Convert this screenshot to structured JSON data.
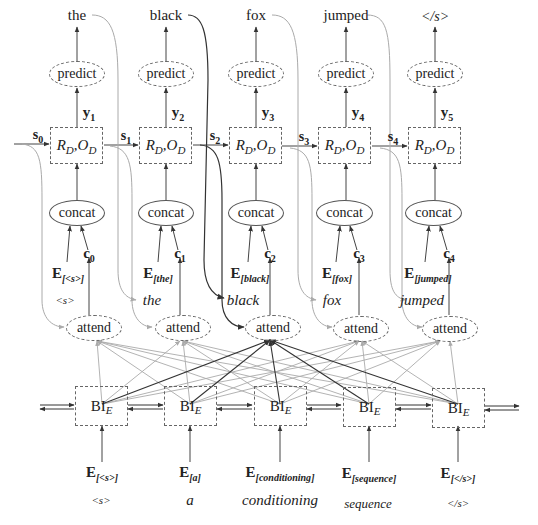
{
  "diagram": {
    "type": "encoder-decoder attention architecture",
    "columns": 5,
    "decoder": {
      "outputs": [
        "the",
        "black",
        "fox",
        "jumped",
        "</s>"
      ],
      "predict_label": "predict",
      "y_labels": [
        {
          "base": "y",
          "sub": "1"
        },
        {
          "base": "y",
          "sub": "2"
        },
        {
          "base": "y",
          "sub": "3"
        },
        {
          "base": "y",
          "sub": "4"
        },
        {
          "base": "y",
          "sub": "5"
        }
      ],
      "rnn_label": {
        "r": "R",
        "r_sub": "D",
        "sep": ", ",
        "o": "O",
        "o_sub": "D"
      },
      "states": [
        {
          "base": "s",
          "sub": "0"
        },
        {
          "base": "s",
          "sub": "1"
        },
        {
          "base": "s",
          "sub": "2"
        },
        {
          "base": "s",
          "sub": "3"
        },
        {
          "base": "s",
          "sub": "4"
        }
      ],
      "concat_label": "concat",
      "embed_inputs": [
        {
          "base": "E",
          "sub": "<s>"
        },
        {
          "base": "E",
          "sub": "the"
        },
        {
          "base": "E",
          "sub": "black"
        },
        {
          "base": "E",
          "sub": "fox"
        },
        {
          "base": "E",
          "sub": "jumped"
        }
      ],
      "contexts": [
        {
          "base": "c",
          "sub": "0"
        },
        {
          "base": "c",
          "sub": "1"
        },
        {
          "base": "c",
          "sub": "2"
        },
        {
          "base": "c",
          "sub": "3"
        },
        {
          "base": "c",
          "sub": "4"
        }
      ],
      "input_words": [
        "<s>",
        "the",
        "black",
        "fox",
        "jumped"
      ],
      "attend_label": "attend",
      "highlighted_column": 2
    },
    "encoder": {
      "bi_label": {
        "base": "BI",
        "sub": "E"
      },
      "embed_inputs": [
        {
          "base": "E",
          "sub": "<s>"
        },
        {
          "base": "E",
          "sub": "a"
        },
        {
          "base": "E",
          "sub": "conditioning"
        },
        {
          "base": "E",
          "sub": "sequence"
        },
        {
          "base": "E",
          "sub": "</s>"
        }
      ],
      "words": [
        "<s>",
        "a",
        "conditioning",
        "sequence",
        "</s>"
      ]
    },
    "colors": {
      "line": "#444444",
      "highlight": "#333333",
      "faded": "#aaaaaa",
      "dash": "#666666"
    }
  }
}
